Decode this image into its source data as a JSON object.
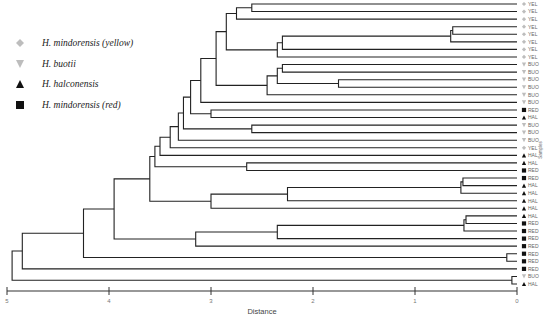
{
  "legend": [
    {
      "label": "H. mindorensis (yellow)",
      "symbol": "diamond",
      "color": "#bdbdbd",
      "code": "YEL"
    },
    {
      "label": "H. buotii",
      "symbol": "triangle-down",
      "color": "#bdbdbd",
      "code": "BUO"
    },
    {
      "label": "H. halconensis",
      "symbol": "triangle-up",
      "color": "#111111",
      "code": "HAL"
    },
    {
      "label": "H. mindorensis (red)",
      "symbol": "square",
      "color": "#111111",
      "code": "RED"
    }
  ],
  "axis": {
    "xlabel": "Distance",
    "ylabel": "Samples",
    "ticks": [
      "5",
      "4",
      "3",
      "2",
      "1",
      "0"
    ],
    "xlim": [
      5,
      0
    ]
  },
  "chart_data": {
    "type": "dendrogram",
    "title": "",
    "xlabel": "Distance",
    "ylabel": "Samples",
    "xlim": [
      5,
      0
    ],
    "legend_position": "upper-left",
    "leaves": [
      "YEL",
      "YEL",
      "YEL",
      "YEL",
      "YEL",
      "YEL",
      "YEL",
      "YEL",
      "BUO",
      "BUO",
      "BUO",
      "BUO",
      "BUO",
      "BUO",
      "RED",
      "HAL",
      "BUO",
      "BUO",
      "BUO",
      "YEL",
      "HAL",
      "HAL",
      "RED",
      "RED",
      "HAL",
      "HAL",
      "HAL",
      "HAL",
      "HAL",
      "RED",
      "RED",
      "RED",
      "RED",
      "RED",
      "RED",
      "RED",
      "BUO",
      "HAL"
    ],
    "merges": [
      {
        "leaves": [
          0,
          1
        ],
        "height": 2.6
      },
      {
        "leaves": [
          3,
          4,
          5
        ],
        "height": 0.65
      },
      {
        "leaves": [
          22,
          23
        ],
        "height": 2.45
      },
      {
        "leaves": [
          25,
          26
        ],
        "height": 0.45
      },
      {
        "leaves": [
          30,
          31
        ],
        "height": 0.5
      },
      {
        "leaves": [
          24,
          25,
          26,
          27
        ],
        "height": 2.25
      },
      {
        "leaves": [
          24,
          25,
          26,
          27,
          28
        ],
        "height": 3.0
      },
      {
        "leaves": [
          29,
          30,
          31,
          32
        ],
        "height": 2.35
      },
      {
        "leaves": [
          29,
          30,
          31,
          32,
          33
        ],
        "height": 3.15
      },
      {
        "height": 4.65,
        "note": "root-inner"
      },
      {
        "height": 4.95,
        "note": "root"
      }
    ]
  }
}
